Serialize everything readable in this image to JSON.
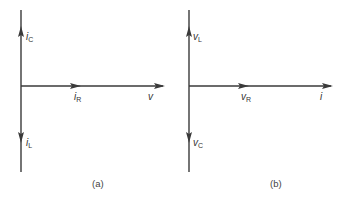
{
  "colors": {
    "axis": "#3a3a3a",
    "text": "#333333",
    "background": "#ffffff"
  },
  "panels": [
    {
      "caption": "(a)",
      "phasors": {
        "up": {
          "main": "i",
          "sub": "C"
        },
        "right_mid": {
          "main": "i",
          "sub": "R"
        },
        "right_end": {
          "main": "v",
          "sub": ""
        },
        "down": {
          "main": "i",
          "sub": "L"
        }
      }
    },
    {
      "caption": "(b)",
      "phasors": {
        "up": {
          "main": "v",
          "sub": "L"
        },
        "right_mid": {
          "main": "v",
          "sub": "R"
        },
        "right_end": {
          "main": "i",
          "sub": ""
        },
        "down": {
          "main": "v",
          "sub": "C"
        }
      }
    }
  ]
}
